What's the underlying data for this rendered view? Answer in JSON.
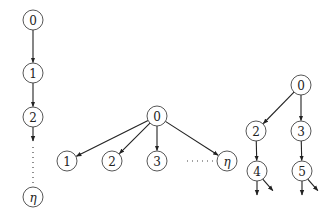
{
  "diagram": {
    "type": "directed-graphs",
    "colors": {
      "stroke": "#222222",
      "node_fill": "#ffffff",
      "text": "#222222"
    },
    "node_radius": 10,
    "graphs": [
      {
        "name": "chain",
        "nodes": [
          {
            "id": "c0",
            "label": "0",
            "x": 33,
            "y": 20
          },
          {
            "id": "c1",
            "label": "1",
            "x": 33,
            "y": 73
          },
          {
            "id": "c2",
            "label": "2",
            "x": 33,
            "y": 117
          },
          {
            "id": "ceta",
            "label": "η",
            "x": 33,
            "y": 197
          }
        ],
        "edges": [
          {
            "from": "c0",
            "to": "c1"
          },
          {
            "from": "c1",
            "to": "c2"
          }
        ],
        "dotted": [
          {
            "from": "c2",
            "to": "ceta"
          }
        ]
      },
      {
        "name": "star",
        "nodes": [
          {
            "id": "s0",
            "label": "0",
            "x": 157,
            "y": 116
          },
          {
            "id": "s1",
            "label": "1",
            "x": 67,
            "y": 161
          },
          {
            "id": "s2",
            "label": "2",
            "x": 112,
            "y": 161
          },
          {
            "id": "s3",
            "label": "3",
            "x": 157,
            "y": 161
          },
          {
            "id": "seta",
            "label": "η",
            "x": 227,
            "y": 161
          }
        ],
        "edges": [
          {
            "from": "s0",
            "to": "s1"
          },
          {
            "from": "s0",
            "to": "s2"
          },
          {
            "from": "s0",
            "to": "s3"
          },
          {
            "from": "s0",
            "to": "seta"
          }
        ],
        "dotted": [
          {
            "from": "s3",
            "to": "seta"
          }
        ]
      },
      {
        "name": "branching-tree",
        "nodes": [
          {
            "id": "t0",
            "label": "0",
            "x": 301,
            "y": 85
          },
          {
            "id": "t2",
            "label": "2",
            "x": 256,
            "y": 131
          },
          {
            "id": "t3",
            "label": "3",
            "x": 301,
            "y": 131
          },
          {
            "id": "t4",
            "label": "4",
            "x": 257,
            "y": 171
          },
          {
            "id": "t5",
            "label": "5",
            "x": 302,
            "y": 171
          }
        ],
        "edges": [
          {
            "from": "t0",
            "to": "t2"
          },
          {
            "from": "t0",
            "to": "t3"
          },
          {
            "from": "t2",
            "to": "t4"
          },
          {
            "from": "t3",
            "to": "t5"
          }
        ],
        "open_arrows": [
          {
            "from": "t4",
            "dx": 0,
            "dy": 1
          },
          {
            "from": "t4",
            "dx": 0.7,
            "dy": 1
          },
          {
            "from": "t5",
            "dx": 0,
            "dy": 1
          },
          {
            "from": "t5",
            "dx": 0.7,
            "dy": 1
          }
        ]
      }
    ]
  }
}
